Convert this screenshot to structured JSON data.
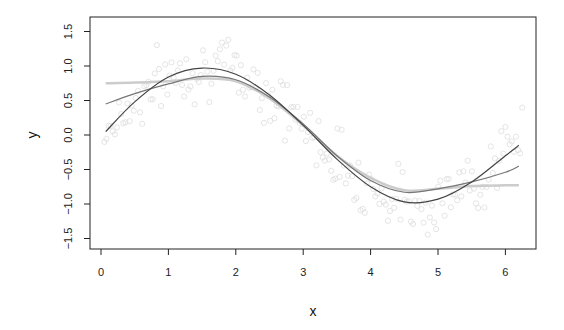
{
  "chart_data": {
    "type": "line",
    "title": "",
    "xlabel": "x",
    "ylabel": "y",
    "xlim": [
      0,
      6.3
    ],
    "ylim": [
      -1.6,
      1.6
    ],
    "x_ticks": [
      "0",
      "1",
      "2",
      "3",
      "4",
      "5",
      "6"
    ],
    "y_ticks": [
      "-1.5",
      "-1.0",
      "-0.5",
      "0.0",
      "0.5",
      "1.0",
      "1.5"
    ],
    "grid": false,
    "legend": null,
    "x": [
      0.07,
      0.5,
      1.0,
      1.5,
      2.0,
      2.5,
      3.0,
      3.5,
      4.0,
      4.5,
      5.0,
      5.5,
      6.0,
      6.2
    ],
    "series": [
      {
        "name": "fit-dark",
        "color": "#444444",
        "values": [
          0.05,
          0.48,
          0.84,
          0.97,
          0.88,
          0.58,
          0.14,
          -0.35,
          -0.75,
          -0.97,
          -0.93,
          -0.68,
          -0.3,
          -0.15
        ]
      },
      {
        "name": "fit-medium",
        "color": "#777777",
        "values": [
          0.45,
          0.6,
          0.74,
          0.85,
          0.8,
          0.55,
          0.16,
          -0.3,
          -0.66,
          -0.83,
          -0.78,
          -0.68,
          -0.54,
          -0.45
        ]
      },
      {
        "name": "fit-light",
        "color": "#cccccc",
        "values": [
          0.75,
          0.76,
          0.78,
          0.82,
          0.78,
          0.53,
          0.14,
          -0.3,
          -0.62,
          -0.8,
          -0.78,
          -0.74,
          -0.73,
          -0.73
        ]
      }
    ],
    "scatter": {
      "name": "observations",
      "color": "#dddddd",
      "marker": "open-circle",
      "description": "noisy samples around sin(x), x in [0, 2π], faint gray open circles"
    }
  }
}
